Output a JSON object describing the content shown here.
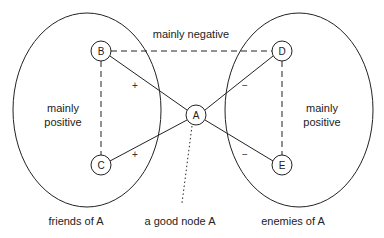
{
  "diagram": {
    "title_top": "mainly negative",
    "groups": [
      {
        "id": "friends",
        "label": "friends of A",
        "inner_line1": "mainly",
        "inner_line2": "positive"
      },
      {
        "id": "enemies",
        "label": "enemies of A",
        "inner_line1": "mainly",
        "inner_line2": "positive"
      }
    ],
    "nodes": {
      "A": "A",
      "B": "B",
      "C": "C",
      "D": "D",
      "E": "E"
    },
    "edges": [
      {
        "from": "A",
        "to": "B",
        "style": "solid",
        "sign": "+"
      },
      {
        "from": "A",
        "to": "C",
        "style": "solid",
        "sign": "+"
      },
      {
        "from": "A",
        "to": "D",
        "style": "solid",
        "sign": "−"
      },
      {
        "from": "A",
        "to": "E",
        "style": "solid",
        "sign": "−"
      },
      {
        "from": "B",
        "to": "C",
        "style": "dashed",
        "sign": ""
      },
      {
        "from": "D",
        "to": "E",
        "style": "dashed",
        "sign": ""
      },
      {
        "from": "B",
        "to": "D",
        "style": "dashed",
        "sign": ""
      }
    ],
    "signs": {
      "ab": "+",
      "ac": "+",
      "ad": "−",
      "ae": "−"
    },
    "annotation": "a good node A",
    "colors": {
      "stroke": "#222222",
      "text": "#222222",
      "background": "#ffffff"
    }
  }
}
